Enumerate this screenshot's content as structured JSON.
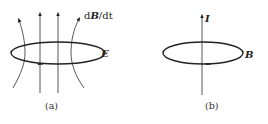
{
  "panels": {
    "a": {
      "caption": "(a)",
      "field_label_d1": "d",
      "field_label_B": "B",
      "field_label_rest": "/dt",
      "loop_label": "E"
    },
    "b": {
      "caption": "(b)",
      "current_label": "I",
      "loop_label": "B"
    }
  },
  "colors": {
    "stroke": "#222222",
    "thin_stroke": "#444444"
  }
}
